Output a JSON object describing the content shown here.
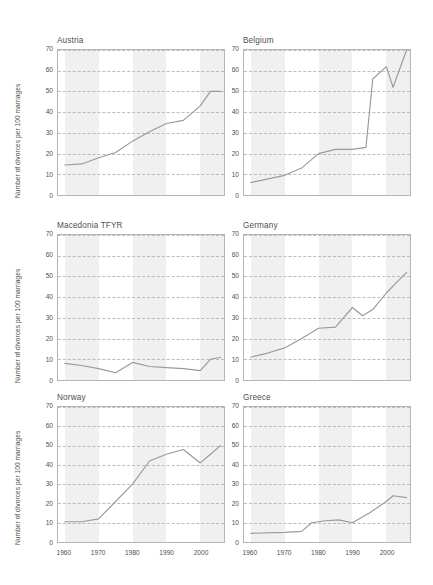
{
  "figure": {
    "ylabel": "Number of divorces per 100 marriages",
    "y_ticks": [
      "0",
      "10",
      "20",
      "30",
      "40",
      "50",
      "60",
      "70"
    ],
    "x_ticks": [
      "1960",
      "1970",
      "1980",
      "1990",
      "2000"
    ],
    "line_color": "#9a9a9a",
    "grid_color": "#9fb6c4",
    "band_color": "#f0f0f0",
    "border_color": "#b5b5b5"
  },
  "chart_data": [
    {
      "type": "line",
      "title": "Austria",
      "xlabel": "",
      "ylabel": "Number of divorces per 100 marriages",
      "xlim": [
        1958,
        2007
      ],
      "ylim": [
        0,
        70
      ],
      "xticks": [
        1960,
        1970,
        1980,
        1990,
        2000
      ],
      "yticks": [
        0,
        10,
        20,
        30,
        40,
        50,
        60,
        70
      ],
      "grid": true,
      "legend": "none",
      "x": [
        1960,
        1965,
        1970,
        1975,
        1980,
        1985,
        1990,
        1995,
        2000,
        2003,
        2006
      ],
      "values": [
        14.5,
        15.0,
        18.0,
        20.5,
        26.0,
        30.5,
        34.5,
        36.0,
        43.0,
        50.0,
        50.0
      ]
    },
    {
      "type": "line",
      "title": "Belgium",
      "xlabel": "",
      "ylabel": "",
      "xlim": [
        1958,
        2007
      ],
      "ylim": [
        0,
        70
      ],
      "xticks": [
        1960,
        1970,
        1980,
        1990,
        2000
      ],
      "yticks": [
        0,
        10,
        20,
        30,
        40,
        50,
        60,
        70
      ],
      "grid": true,
      "legend": "none",
      "x": [
        1960,
        1970,
        1975,
        1980,
        1985,
        1990,
        1994,
        1996,
        2000,
        2002,
        2006
      ],
      "values": [
        6.0,
        9.5,
        13.0,
        20.0,
        22.0,
        22.0,
        23.0,
        56.0,
        62.0,
        52.0,
        70.0
      ]
    },
    {
      "type": "line",
      "title": "Macedonia TFYR",
      "xlabel": "",
      "ylabel": "Number of divorces per 100 marriages",
      "xlim": [
        1958,
        2007
      ],
      "ylim": [
        0,
        70
      ],
      "xticks": [
        1960,
        1970,
        1980,
        1990,
        2000
      ],
      "yticks": [
        0,
        10,
        20,
        30,
        40,
        50,
        60,
        70
      ],
      "grid": true,
      "legend": "none",
      "x": [
        1960,
        1965,
        1970,
        1975,
        1980,
        1985,
        1990,
        1995,
        2000,
        2003,
        2006
      ],
      "values": [
        8.0,
        7.0,
        5.5,
        3.5,
        8.5,
        6.5,
        6.0,
        5.5,
        4.5,
        10.0,
        11.0
      ]
    },
    {
      "type": "line",
      "title": "Germany",
      "xlabel": "",
      "ylabel": "",
      "xlim": [
        1958,
        2007
      ],
      "ylim": [
        0,
        70
      ],
      "xticks": [
        1960,
        1970,
        1980,
        1990,
        2000
      ],
      "yticks": [
        0,
        10,
        20,
        30,
        40,
        50,
        60,
        70
      ],
      "grid": true,
      "legend": "none",
      "x": [
        1960,
        1965,
        1970,
        1975,
        1980,
        1985,
        1990,
        1993,
        1996,
        2000,
        2003,
        2006
      ],
      "values": [
        11.0,
        13.0,
        15.5,
        20.0,
        25.0,
        25.5,
        35.0,
        31.0,
        34.0,
        42.0,
        47.0,
        52.0
      ]
    },
    {
      "type": "line",
      "title": "Norway",
      "xlabel": "",
      "ylabel": "Number of divorces per 100 marriages",
      "xlim": [
        1958,
        2007
      ],
      "ylim": [
        0,
        70
      ],
      "xticks": [
        1960,
        1970,
        1980,
        1990,
        2000
      ],
      "yticks": [
        0,
        10,
        20,
        30,
        40,
        50,
        60,
        70
      ],
      "grid": true,
      "legend": "none",
      "x": [
        1960,
        1965,
        1970,
        1975,
        1980,
        1985,
        1990,
        1995,
        2000,
        2003,
        2006
      ],
      "values": [
        10.5,
        10.5,
        12.0,
        21.0,
        30.0,
        42.0,
        45.5,
        48.0,
        41.0,
        45.5,
        50.0
      ]
    },
    {
      "type": "line",
      "title": "Greece",
      "xlabel": "",
      "ylabel": "",
      "xlim": [
        1958,
        2007
      ],
      "ylim": [
        0,
        70
      ],
      "xticks": [
        1960,
        1970,
        1980,
        1990,
        2000
      ],
      "yticks": [
        0,
        10,
        20,
        30,
        40,
        50,
        60,
        70
      ],
      "grid": true,
      "legend": "none",
      "x": [
        1960,
        1970,
        1975,
        1978,
        1982,
        1986,
        1990,
        1995,
        2000,
        2002,
        2006
      ],
      "values": [
        4.5,
        5.0,
        5.5,
        10.0,
        11.0,
        11.5,
        10.0,
        15.0,
        21.0,
        24.0,
        23.0
      ]
    }
  ]
}
